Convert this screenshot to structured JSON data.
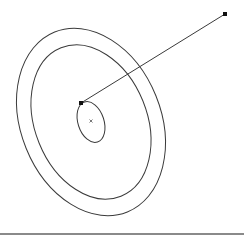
{
  "diagram": {
    "background": "#ffffff",
    "stroke_color": "#3a3a3a",
    "ellipses": [
      {
        "name": "outer-ellipse",
        "cx": 91,
        "cy": 122,
        "rx": 70,
        "ry": 97,
        "rotate": -22
      },
      {
        "name": "middle-ellipse",
        "cx": 91,
        "cy": 122,
        "rx": 56,
        "ry": 80,
        "rotate": -22
      },
      {
        "name": "inner-ellipse",
        "cx": 91,
        "cy": 122,
        "rx": 13,
        "ry": 21,
        "rotate": -18
      }
    ],
    "line": {
      "x1": 81,
      "y1": 103,
      "x2": 225,
      "y2": 14
    },
    "handles": [
      {
        "name": "handle-inner",
        "x": 81,
        "y": 103
      },
      {
        "name": "handle-outer",
        "x": 225,
        "y": 14
      }
    ],
    "center_mark": {
      "x": 91,
      "y": 121,
      "glyph": "×"
    },
    "separator_color": "#8a8a8a"
  }
}
